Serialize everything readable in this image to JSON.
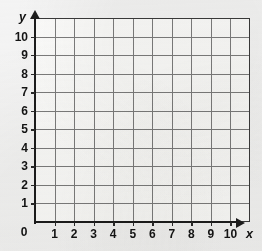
{
  "figure": {
    "kind": "coordinate-grid",
    "background_color": "#f6f6f6",
    "grid_fill_color": "#fdfdfc",
    "grid_line_color": "#7d7d7d",
    "grid_border_color": "#3a3a3a",
    "axis_color": "#1c1c1c",
    "label_color": "#141414"
  },
  "axes": {
    "x_axis_label": "x",
    "y_axis_label": "y",
    "origin_label": "0",
    "x_ticks": [
      "1",
      "2",
      "3",
      "4",
      "5",
      "6",
      "7",
      "8",
      "9",
      "10"
    ],
    "y_ticks": [
      "1",
      "2",
      "3",
      "4",
      "5",
      "6",
      "7",
      "8",
      "9",
      "10"
    ]
  },
  "chart_data": {
    "type": "scatter",
    "title": "",
    "subtitle": "",
    "xlabel": "x",
    "ylabel": "y",
    "xlim": [
      0,
      11
    ],
    "ylim": [
      0,
      11
    ],
    "xticks": [
      0,
      1,
      2,
      3,
      4,
      5,
      6,
      7,
      8,
      9,
      10
    ],
    "yticks": [
      0,
      1,
      2,
      3,
      4,
      5,
      6,
      7,
      8,
      9,
      10
    ],
    "xticklabels": [
      "0",
      "1",
      "2",
      "3",
      "4",
      "5",
      "6",
      "7",
      "8",
      "9",
      "10"
    ],
    "yticklabels": [
      "0",
      "1",
      "2",
      "3",
      "4",
      "5",
      "6",
      "7",
      "8",
      "9",
      "10"
    ],
    "grid": true,
    "grid_spacing": 1,
    "grid_columns": 11,
    "grid_rows": 11,
    "legend": null,
    "legend_position": "none",
    "annotations": [],
    "series": [],
    "x": [],
    "values": [],
    "note": "Empty blank coordinate grid with arrowed x and y axes; no data plotted."
  }
}
